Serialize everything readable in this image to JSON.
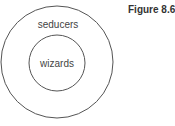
{
  "figure": {
    "label": "Figure 8.6"
  },
  "diagram": {
    "type": "nested-sets",
    "outer_set": {
      "label": "seducers",
      "cx": 57,
      "cy": 62,
      "r": 56
    },
    "inner_set": {
      "label": "wizards",
      "cx": 57,
      "cy": 63,
      "r": 28
    }
  },
  "colors": {
    "stroke": "#555555",
    "text": "#444444",
    "background": "#ffffff"
  }
}
